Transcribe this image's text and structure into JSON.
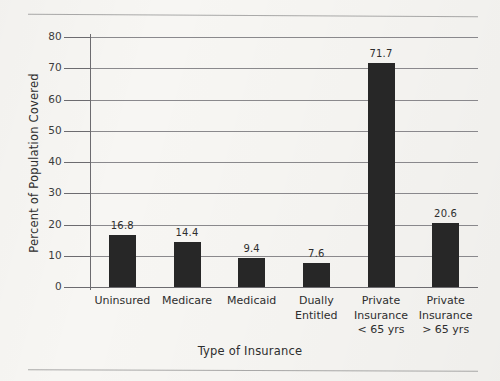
{
  "chart_data": {
    "type": "bar",
    "title": "",
    "subtitle": "",
    "xlabel": "Type of Insurance",
    "ylabel": "Percent of Population Covered",
    "categories": [
      "Uninsured",
      "Medicare",
      "Medicaid",
      "Dually\nEntitled",
      "Private\nInsurance\n< 65 yrs",
      "Private\nInsurance\n> 65 yrs"
    ],
    "values": [
      16.8,
      14.4,
      9.4,
      7.6,
      71.7,
      20.6
    ],
    "value_labels": [
      "16.8",
      "14.4",
      "9.4",
      "7.6",
      "71.7",
      "20.6"
    ],
    "ylim": [
      0,
      80
    ],
    "ytick_values": [
      0,
      10,
      20,
      30,
      40,
      50,
      60,
      70,
      80
    ],
    "ytick_labels": [
      "0",
      "10",
      "20",
      "30",
      "40",
      "50",
      "60",
      "70",
      "80"
    ],
    "grid": true,
    "grid_axis": "y",
    "legend": false,
    "legend_position": "none",
    "bar_color": "#272727",
    "grid_color": "#77767a",
    "axis_color": "#6c6b6f",
    "background_color": "#f7f6f3",
    "text_color": "#2e2e2e"
  }
}
